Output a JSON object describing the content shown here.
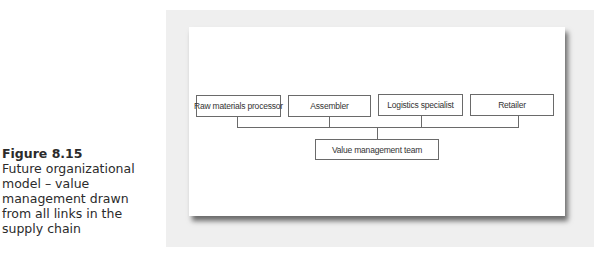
{
  "caption": {
    "figure_number": "Figure 8.15",
    "text": "Future organizational model – value management drawn from all links in the supply chain"
  },
  "diagram": {
    "top_nodes": [
      {
        "label": "Raw materials processor"
      },
      {
        "label": "Assembler"
      },
      {
        "label": "Logistics specialist"
      },
      {
        "label": "Retailer"
      }
    ],
    "bottom_node": {
      "label": "Value management team"
    },
    "colors": {
      "backdrop": "#efefef",
      "panel": "#ffffff",
      "line": "#6a6a6a",
      "text": "#333333"
    }
  }
}
